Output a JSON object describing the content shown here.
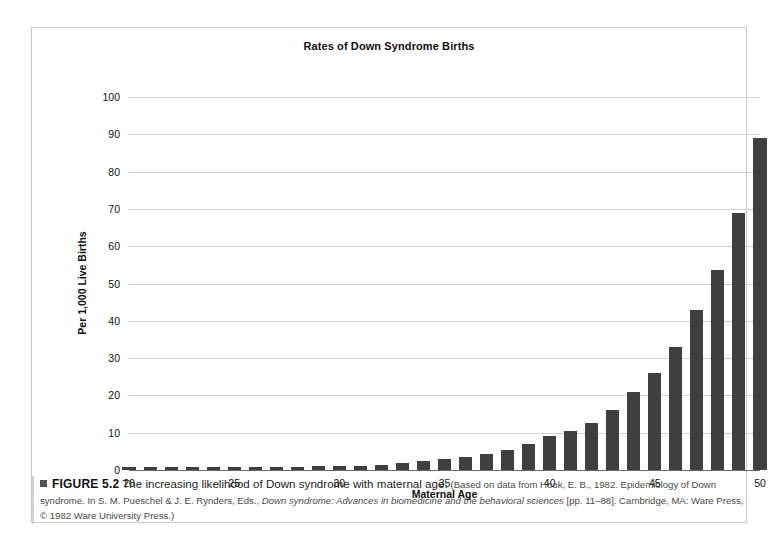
{
  "figure": {
    "title": "Rates of Down Syndrome Births",
    "caption_label": "FIGURE 5.2",
    "caption_lead": "The increasing likelihood of Down syndrome with maternal age.",
    "caption_source_a": "(Based on data from Hook, E. B., 1982. Epidemiology of Down syndrome. In S. M. Pueschel & J. E. Rynders, Eds., ",
    "caption_source_italic": "Down syndrome: Advances in biomedicine and the behavioral sciences",
    "caption_source_b": " [pp. 11–88]. Cambridge, MA: Ware Press, © 1982 Ware University Press.)",
    "marker_icon": "square-bullet-icon"
  },
  "chart_data": {
    "type": "bar",
    "title": "Rates of Down Syndrome Births",
    "xlabel": "Maternal Age",
    "ylabel": "Per 1,000 Live Births",
    "xlim": [
      20,
      50
    ],
    "ylim": [
      0,
      100
    ],
    "ytick_values": [
      0,
      10,
      20,
      30,
      40,
      50,
      60,
      70,
      80,
      90,
      100
    ],
    "ytick_labels": [
      "0",
      "10",
      "20",
      "30",
      "40",
      "50",
      "60",
      "70",
      "80",
      "90",
      "100"
    ],
    "xtick_values": [
      20,
      25,
      30,
      35,
      40,
      45,
      50
    ],
    "xtick_labels": [
      "20",
      "25",
      "30",
      "35",
      "40",
      "45",
      "50"
    ],
    "grid": "horizontal",
    "legend": "none",
    "bar_color": "#3f3f3f",
    "categories": [
      20,
      21,
      22,
      23,
      24,
      25,
      26,
      27,
      28,
      29,
      30,
      31,
      32,
      33,
      34,
      35,
      36,
      37,
      38,
      39,
      40,
      41,
      42,
      43,
      44,
      45,
      46,
      47,
      48,
      49,
      50
    ],
    "values": [
      0.7,
      0.7,
      0.7,
      0.7,
      0.8,
      0.8,
      0.8,
      0.9,
      0.9,
      1.0,
      1.1,
      1.2,
      1.4,
      1.8,
      2.4,
      3.0,
      3.6,
      4.4,
      5.5,
      7.0,
      9.0,
      10.5,
      12.5,
      16.0,
      21.0,
      26.0,
      33.0,
      43.0,
      53.7,
      69.0,
      89.0
    ],
    "series": [
      {
        "name": "Down syndrome births per 1,000 live births",
        "values": [
          0.7,
          0.7,
          0.7,
          0.7,
          0.8,
          0.8,
          0.8,
          0.9,
          0.9,
          1.0,
          1.1,
          1.2,
          1.4,
          1.8,
          2.4,
          3.0,
          3.6,
          4.4,
          5.5,
          7.0,
          9.0,
          10.5,
          12.5,
          16.0,
          21.0,
          26.0,
          33.0,
          43.0,
          53.7,
          69.0,
          89.0
        ]
      }
    ]
  }
}
